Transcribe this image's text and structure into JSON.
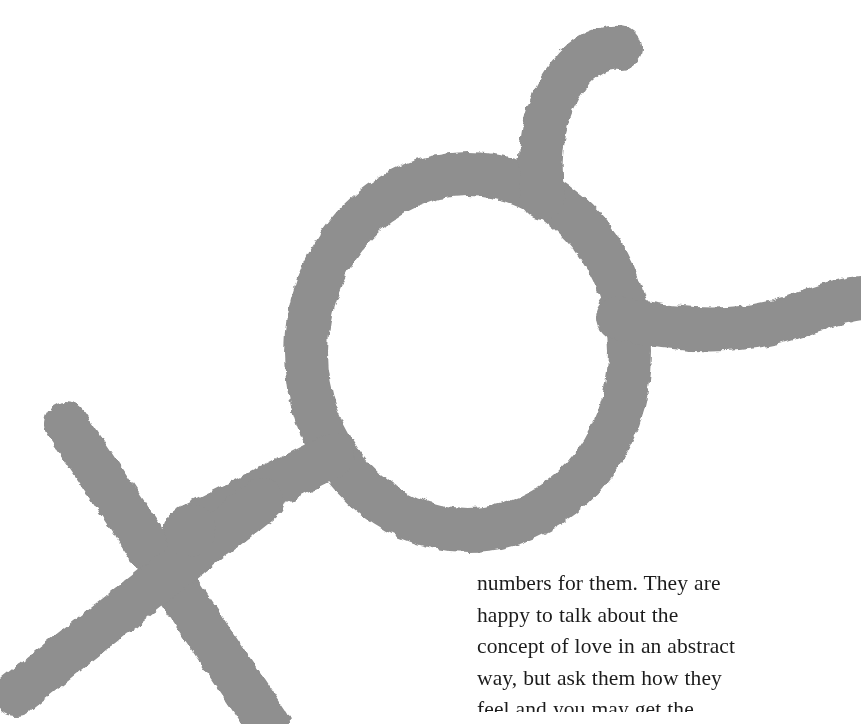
{
  "page": {
    "width": 861,
    "height": 724,
    "background_color": "#ffffff",
    "kind": "scanned-book-page"
  },
  "symbol": {
    "name": "alchemical-venus-cross-symbol",
    "description": "Large gray line-drawn symbol: a ring with a hook curving up-right from its top, a short arm extending right to the page edge, and a long stem running down-left into an X-shaped cross",
    "ink_color": "#8f8f8f",
    "stroke_width": 44,
    "parts": [
      "ring",
      "top-hook",
      "right-arm",
      "lower-left-stem",
      "cross"
    ]
  },
  "body_text": {
    "color": "#1c1c1c",
    "lines": [
      "numbers for them. They are",
      "happy to talk about the",
      "concept of love in an abstract",
      "way, but ask them how they",
      "feel and you may get the"
    ]
  }
}
